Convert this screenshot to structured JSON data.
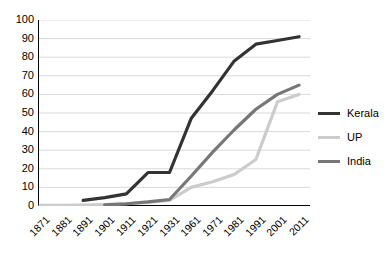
{
  "chart_data": {
    "type": "line",
    "title": "",
    "xlabel": "",
    "ylabel": "",
    "x": [
      "1871",
      "1881",
      "1891",
      "1901",
      "1911",
      "1921",
      "1931",
      "1961",
      "1971",
      "1981",
      "1991",
      "2001",
      "2011"
    ],
    "categories": [
      "1871",
      "1881",
      "1891",
      "1901",
      "1911",
      "1921",
      "1931",
      "1961",
      "1971",
      "1981",
      "1991",
      "2001",
      "2011"
    ],
    "ylim": [
      0,
      100
    ],
    "yticks": [
      0,
      10,
      20,
      30,
      40,
      50,
      60,
      70,
      80,
      90,
      100
    ],
    "ytick_labels": [
      "0",
      "10",
      "20",
      "30",
      "40",
      "50",
      "60",
      "70",
      "80",
      "90",
      "100"
    ],
    "grid": "horizontal",
    "legend_position": "right",
    "series": [
      {
        "name": "Kerala",
        "color": "#333333",
        "width": 3.2,
        "values": [
          null,
          null,
          3,
          4.5,
          6.5,
          18,
          18,
          47,
          62,
          78,
          87,
          89,
          91
        ]
      },
      {
        "name": "UP",
        "color": "#cccccc",
        "width": 3.2,
        "values": [
          0.3,
          0.4,
          0.5,
          0.8,
          1.2,
          2.0,
          3.0,
          10,
          13,
          17,
          25,
          56,
          60
        ]
      },
      {
        "name": "India",
        "color": "#777777",
        "width": 3.2,
        "values": [
          null,
          null,
          null,
          0.6,
          1.2,
          2.2,
          3.5,
          16,
          29,
          41,
          52,
          60,
          65
        ]
      }
    ]
  },
  "legend": {
    "items": [
      {
        "label": "Kerala",
        "color": "#333333"
      },
      {
        "label": "UP",
        "color": "#cccccc"
      },
      {
        "label": "India",
        "color": "#777777"
      }
    ]
  },
  "axes": {
    "axis_color": "#000000",
    "grid_color": "#d9d9d9"
  }
}
